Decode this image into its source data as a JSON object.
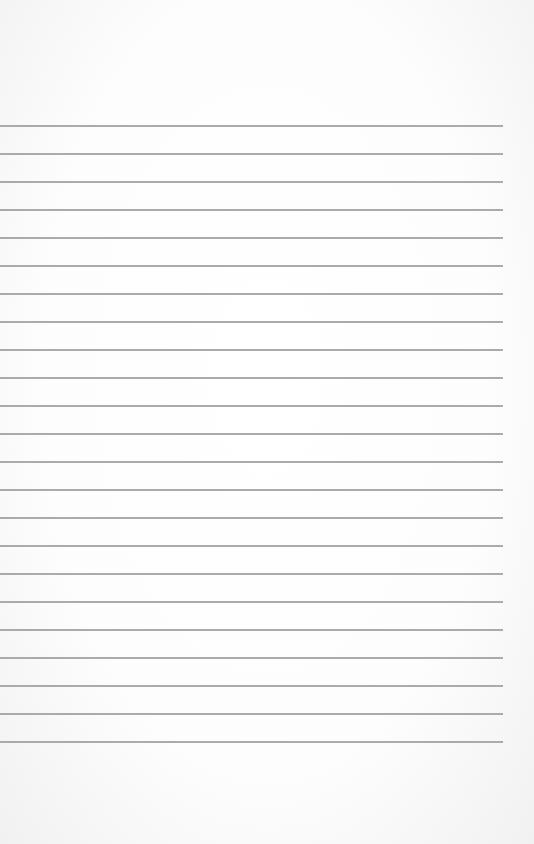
{
  "page": {
    "type": "lined-paper",
    "background_color": "#fbfbfb",
    "line_color": "#9c9c9c",
    "line_count": 23,
    "first_line_y": 125,
    "line_spacing": 28,
    "line_start_x": 0,
    "line_end_x": 503
  }
}
